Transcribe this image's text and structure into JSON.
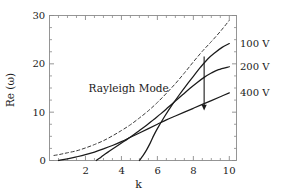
{
  "chart_data": {
    "type": "line",
    "title": "",
    "xlabel": "k",
    "ylabel": "Re (ω)",
    "xlim": [
      0,
      10.4
    ],
    "ylim": [
      0,
      30
    ],
    "xticks": [
      2,
      4,
      6,
      8,
      10
    ],
    "xtick_labels": [
      "2",
      "4",
      "6",
      "8",
      "10"
    ],
    "yticks": [
      0,
      10,
      20,
      30
    ],
    "ytick_labels": [
      "0",
      "10",
      "20",
      "30"
    ],
    "x_minor_step": 0.5,
    "y_minor_step": 2.5,
    "grid": false,
    "legend_position": "right-inline",
    "annotations": [
      {
        "name": "rayleigh-mode-annotation",
        "text": "Rayleigh Mode",
        "x": 4.4,
        "y": 15.0
      },
      {
        "name": "voltage-direction-arrow",
        "text": "",
        "x": 8.6,
        "y": 10.5,
        "direction": "down"
      }
    ],
    "series": [
      {
        "name": "Rayleigh Mode",
        "label": "Rayleigh Mode",
        "style": "dashed",
        "color": "#3a3a3a",
        "points": [
          [
            0.25,
            1.05
          ],
          [
            0.5,
            1.2
          ],
          [
            0.75,
            1.4
          ],
          [
            1.0,
            1.6
          ],
          [
            1.5,
            2.0
          ],
          [
            2.0,
            2.6
          ],
          [
            2.5,
            3.3
          ],
          [
            3.0,
            4.1
          ],
          [
            3.5,
            5.1
          ],
          [
            4.0,
            6.2
          ],
          [
            4.5,
            7.4
          ],
          [
            5.0,
            8.8
          ],
          [
            5.5,
            10.3
          ],
          [
            6.0,
            12.0
          ],
          [
            6.5,
            13.9
          ],
          [
            7.0,
            15.9
          ],
          [
            7.5,
            18.1
          ],
          [
            8.0,
            20.4
          ],
          [
            8.5,
            22.6
          ],
          [
            9.0,
            24.6
          ],
          [
            9.5,
            26.7
          ],
          [
            10.0,
            29.0
          ]
        ]
      },
      {
        "name": "100 V",
        "label": "100 V",
        "style": "solid",
        "color": "#1a1a1a",
        "points": [
          [
            5.0,
            0.0
          ],
          [
            5.2,
            1.0
          ],
          [
            5.4,
            2.2
          ],
          [
            5.6,
            3.6
          ],
          [
            5.8,
            5.2
          ],
          [
            6.0,
            6.6
          ],
          [
            6.4,
            9.1
          ],
          [
            6.8,
            11.4
          ],
          [
            7.2,
            13.5
          ],
          [
            7.6,
            15.5
          ],
          [
            8.0,
            17.4
          ],
          [
            8.4,
            19.3
          ],
          [
            8.8,
            21.0
          ],
          [
            9.2,
            22.3
          ],
          [
            9.6,
            23.4
          ],
          [
            10.0,
            24.2
          ]
        ]
      },
      {
        "name": "200 V",
        "label": "200 V",
        "style": "solid",
        "color": "#1a1a1a",
        "points": [
          [
            2.6,
            0.0
          ],
          [
            2.8,
            0.5
          ],
          [
            3.0,
            1.1
          ],
          [
            3.4,
            2.1
          ],
          [
            3.8,
            3.1
          ],
          [
            4.2,
            4.1
          ],
          [
            4.6,
            5.1
          ],
          [
            5.0,
            6.2
          ],
          [
            5.4,
            7.3
          ],
          [
            5.8,
            8.5
          ],
          [
            6.2,
            9.7
          ],
          [
            6.6,
            11.0
          ],
          [
            7.0,
            12.3
          ],
          [
            7.4,
            13.6
          ],
          [
            7.8,
            14.9
          ],
          [
            8.2,
            16.1
          ],
          [
            8.6,
            17.2
          ],
          [
            9.0,
            18.1
          ],
          [
            9.4,
            18.8
          ],
          [
            10.0,
            19.4
          ]
        ]
      },
      {
        "name": "400 V",
        "label": "400 V",
        "style": "solid",
        "color": "#1a1a1a",
        "points": [
          [
            0.5,
            0.0
          ],
          [
            1.0,
            0.35
          ],
          [
            1.5,
            0.75
          ],
          [
            2.0,
            1.2
          ],
          [
            2.5,
            1.75
          ],
          [
            3.0,
            2.4
          ],
          [
            3.5,
            3.1
          ],
          [
            4.0,
            3.9
          ],
          [
            4.5,
            4.8
          ],
          [
            5.0,
            5.7
          ],
          [
            5.5,
            6.6
          ],
          [
            6.0,
            7.5
          ],
          [
            6.5,
            8.4
          ],
          [
            7.0,
            9.2
          ],
          [
            7.5,
            10.0
          ],
          [
            8.0,
            10.8
          ],
          [
            8.5,
            11.6
          ],
          [
            9.0,
            12.4
          ],
          [
            9.5,
            13.2
          ],
          [
            10.0,
            14.0
          ]
        ]
      }
    ],
    "series_labels": [
      {
        "text": "100 V",
        "at_x": 10.0,
        "at_y": 24.2
      },
      {
        "text": "200 V",
        "at_x": 10.0,
        "at_y": 19.4
      },
      {
        "text": "400 V",
        "at_x": 10.0,
        "at_y": 14.0
      }
    ]
  },
  "axes": {
    "frame_color": "#8a8a8a",
    "tick_color": "#8a8a8a",
    "background": "#ffffff"
  }
}
